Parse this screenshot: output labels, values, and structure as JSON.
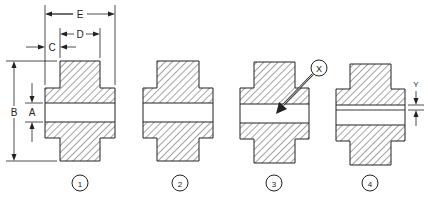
{
  "diagram": {
    "type": "cross-section",
    "colors": {
      "stroke": "#222222",
      "hatch": "#333333",
      "background": "#ffffff"
    },
    "parts": [
      {
        "number": "1",
        "bore_gap": "wide",
        "annotations": [
          "A",
          "B",
          "C",
          "D",
          "E"
        ]
      },
      {
        "number": "2",
        "bore_gap": "wide",
        "annotations": []
      },
      {
        "number": "3",
        "bore_gap": "wide",
        "annotations": [
          "X"
        ]
      },
      {
        "number": "4",
        "bore_gap": "narrow-line",
        "annotations": [
          "Y"
        ]
      }
    ],
    "dimension_labels": {
      "A": "A",
      "B": "B",
      "C": "C",
      "D": "D",
      "E": "E",
      "X": "X",
      "Y": "Y"
    }
  }
}
